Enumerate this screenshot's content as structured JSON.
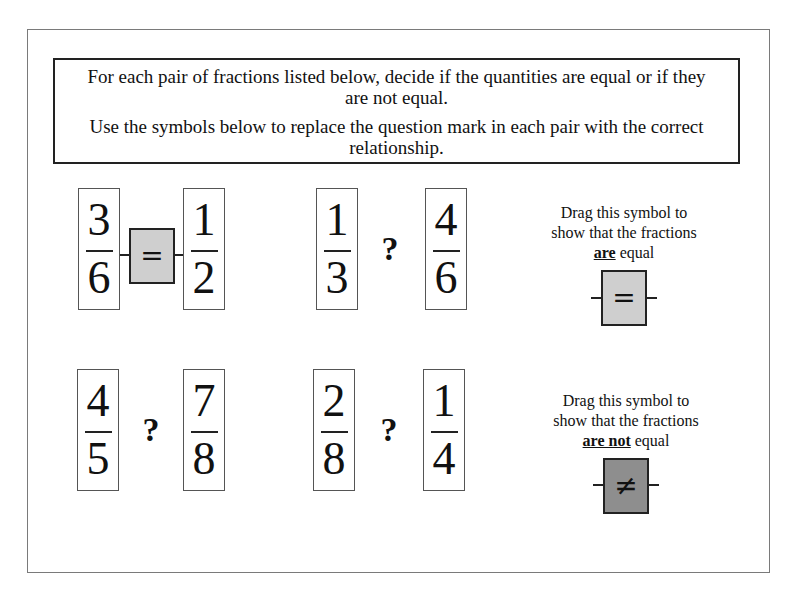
{
  "instructions": {
    "line1": "For each pair of fractions listed below, decide if the quantities are equal or if they are not equal.",
    "line2": "Use the symbols below to replace the question mark in each pair with the correct relationship."
  },
  "pairs": [
    {
      "left": {
        "num": "3",
        "den": "6"
      },
      "relation": "=",
      "right": {
        "num": "1",
        "den": "2"
      }
    },
    {
      "left": {
        "num": "1",
        "den": "3"
      },
      "relation": "?",
      "right": {
        "num": "4",
        "den": "6"
      }
    },
    {
      "left": {
        "num": "4",
        "den": "5"
      },
      "relation": "?",
      "right": {
        "num": "7",
        "den": "8"
      }
    },
    {
      "left": {
        "num": "2",
        "den": "8"
      },
      "relation": "?",
      "right": {
        "num": "1",
        "den": "4"
      }
    }
  ],
  "palette": {
    "equal": {
      "line1": "Drag this symbol to",
      "line2": "show that the fractions",
      "emphasis": "are",
      "suffix": " equal",
      "symbol": "="
    },
    "not_equal": {
      "line1": "Drag this symbol to",
      "line2": "show that the fractions",
      "emphasis": "are not",
      "suffix": " equal",
      "symbol": "≠"
    }
  },
  "colors": {
    "equal_symbol_fill": "#cfcfcf",
    "not_equal_symbol_fill": "#8e8e8e"
  }
}
